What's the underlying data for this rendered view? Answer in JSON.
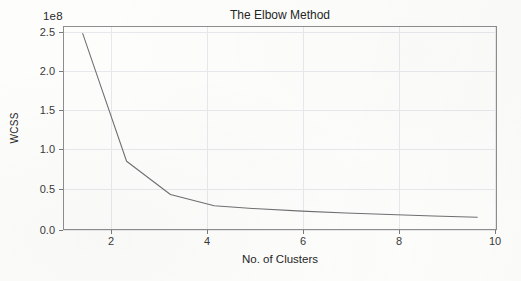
{
  "chart_data": {
    "type": "line",
    "title": "The Elbow Method",
    "xlabel": "No. of Clusters",
    "ylabel": "WCSS",
    "y_offset_text": "1e8",
    "y_scale_factor": 100000000,
    "x": [
      1,
      2,
      3,
      4,
      5,
      6,
      7,
      8,
      9,
      10
    ],
    "values": [
      248000000,
      79000000,
      35000000,
      20000000,
      16000000,
      13000000,
      10500000,
      8500000,
      6500000,
      5000000
    ],
    "values_scaled": [
      2.48,
      0.79,
      0.35,
      0.2,
      0.16,
      0.13,
      0.105,
      0.085,
      0.065,
      0.05
    ],
    "xlim": [
      0.55,
      10.45
    ],
    "ylim": [
      -0.12,
      2.58
    ],
    "xticks": [
      2,
      4,
      6,
      8,
      10
    ],
    "xtick_labels": [
      "2",
      "4",
      "6",
      "8",
      "10"
    ],
    "yticks": [
      0.0,
      0.5,
      1.0,
      1.5,
      2.0,
      2.5
    ],
    "ytick_labels": [
      "0.0",
      "0.5",
      "1.0",
      "1.5",
      "2.0",
      "2.5"
    ],
    "grid": true,
    "legend": null,
    "series_name": "WCSS",
    "line_color": "#6f6f72",
    "grid_color": "#e8e8ec",
    "axis_color": "#8d8d8d",
    "background_color": "#fdfdfc",
    "elbow_point": 2
  }
}
